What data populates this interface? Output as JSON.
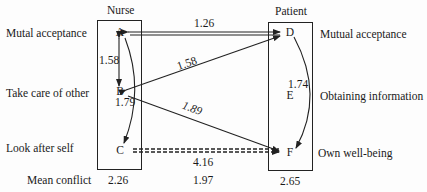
{
  "headers": {
    "nurse": "Nurse",
    "patient": "Patient"
  },
  "left_labels": [
    "Mutal acceptance",
    "Take care of other",
    "Look after self"
  ],
  "right_labels": [
    "Mutual acceptance",
    "Obtaining information",
    "Own well-being"
  ],
  "nodes": {
    "nurse": [
      "A",
      "B",
      "C"
    ],
    "patient": [
      "D",
      "E",
      "F"
    ]
  },
  "edges": [
    {
      "from": "A",
      "to": "D",
      "value": "1.26",
      "style": "double-arrow"
    },
    {
      "from": "A",
      "to": "B",
      "value": "1.58",
      "style": "double-arrow"
    },
    {
      "from": "B",
      "to": "D",
      "value": "1.58",
      "style": "double-arrow"
    },
    {
      "from": "B",
      "to": "C",
      "value": "1.79",
      "style": "curved-arrow"
    },
    {
      "from": "B",
      "to": "F",
      "value": "1.89",
      "style": "arrow"
    },
    {
      "from": "D",
      "to": "F",
      "value": "1.74",
      "style": "curved-arrow"
    },
    {
      "from": "C",
      "to": "F",
      "value": "4.16",
      "style": "dashed-arrow"
    }
  ],
  "footer": {
    "label": "Mean conflict",
    "nurse": "2.26",
    "between": "1.97",
    "patient": "2.65"
  }
}
